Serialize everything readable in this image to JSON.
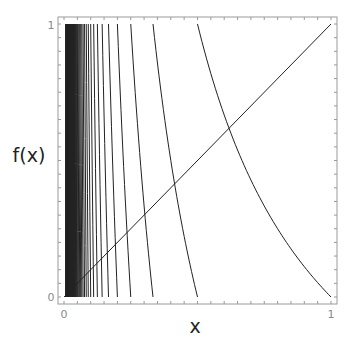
{
  "chart_data": {
    "type": "line",
    "title": "",
    "xlabel": "x",
    "ylabel": "f(x)",
    "xlim": [
      0,
      1
    ],
    "ylim": [
      0,
      1
    ],
    "grid": false,
    "legend": null,
    "x_tick_labels": [
      "0",
      "1"
    ],
    "y_tick_labels": [
      "0",
      "1"
    ],
    "minor_tick_step": 0.05,
    "series": [
      {
        "name": "f(x) = 1/x - floor(1/x)",
        "kind": "function",
        "expression": "frac(1/x)",
        "x_range": [
          0.008,
          1
        ],
        "sample_points": [
          {
            "x": 1.0,
            "y": 0.0
          },
          {
            "x": 0.8,
            "y": 0.25
          },
          {
            "x": 0.618,
            "y": 0.618
          },
          {
            "x": 0.5001,
            "y": 0.9996
          },
          {
            "x": 0.5,
            "y": 0.0
          },
          {
            "x": 0.4,
            "y": 0.5
          },
          {
            "x": 0.3334,
            "y": 0.9994
          },
          {
            "x": 0.3333,
            "y": 0.0
          },
          {
            "x": 0.25,
            "y": 0.0
          },
          {
            "x": 0.2,
            "y": 0.0
          },
          {
            "x": 0.1667,
            "y": 0.0
          },
          {
            "x": 0.1429,
            "y": 0.0
          },
          {
            "x": 0.125,
            "y": 0.0
          },
          {
            "x": 0.1111,
            "y": 0.0
          },
          {
            "x": 0.1,
            "y": 0.0
          }
        ],
        "color": "#222222"
      },
      {
        "name": "y = x",
        "kind": "line",
        "x": [
          0,
          1
        ],
        "y": [
          0,
          1
        ],
        "color": "#222222"
      }
    ],
    "annotations": []
  },
  "labels": {
    "x_axis": "x",
    "y_axis": "f(x)",
    "x_tick_0": "0",
    "x_tick_1": "1",
    "y_tick_0": "0",
    "y_tick_1": "1"
  },
  "colors": {
    "frame": "#9a9a9a",
    "curve": "#222222",
    "background": "#ffffff"
  }
}
